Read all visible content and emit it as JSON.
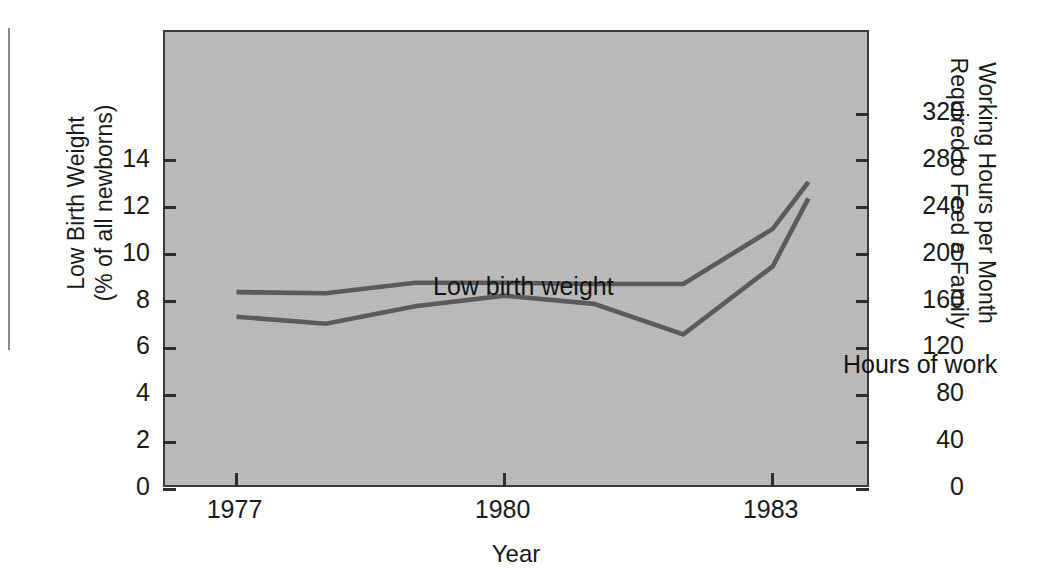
{
  "figure": {
    "background_color": "#ffffff",
    "plot_background_color": "#b9b9b9",
    "line_color": "#5b5b5b",
    "axis_color": "#2e2e2e",
    "width": 1041,
    "height": 581
  },
  "chart_data": {
    "type": "line",
    "title": "",
    "subtitle": "",
    "xlabel": "Year",
    "ylabel": "Low Birth Weight\n(% of all newborns)",
    "y2label": "Working Hours per Month\nRequired to Feed a Family",
    "grid": false,
    "legend_position": "inline-annotations",
    "xlim": [
      1976.2,
      1984.1
    ],
    "ylim": [
      0,
      19.5
    ],
    "y2lim": [
      0,
      390
    ],
    "xticks": [
      1977,
      1980,
      1983
    ],
    "xticklabels": [
      "1977",
      "1980",
      "1983"
    ],
    "yticks": [
      0,
      2,
      4,
      6,
      8,
      10,
      12,
      14
    ],
    "yticklabels": [
      "0",
      "2",
      "4",
      "6",
      "8",
      "10",
      "12",
      "14"
    ],
    "y2ticks": [
      0,
      40,
      80,
      120,
      160,
      200,
      240,
      280,
      320
    ],
    "y2ticklabels": [
      "0",
      "40",
      "80",
      "120",
      "160",
      "200",
      "240",
      "280",
      "320"
    ],
    "x": [
      1977,
      1978,
      1979,
      1980,
      1981,
      1982,
      1983,
      1983.4
    ],
    "series": [
      {
        "name": "Low birth weight",
        "axis": "left",
        "units": "% of all newborns",
        "annotation": "Low birth weight",
        "values": [
          8.4,
          8.35,
          8.8,
          8.8,
          8.75,
          8.75,
          11.1,
          13.1
        ]
      },
      {
        "name": "Hours of work",
        "axis": "right",
        "units": "working hours per month",
        "annotation": "Hours of work",
        "values": [
          147,
          141,
          156,
          165,
          158,
          132,
          190,
          248
        ]
      }
    ]
  },
  "annotations": {
    "low_birth_weight": "Low birth weight",
    "hours_of_work": "Hours of work"
  },
  "axes": {
    "x_title": "Year",
    "left_title": "Low Birth Weight\n(% of all newborns)",
    "right_title": "Working Hours per Month\nRequired to Feed a Family"
  }
}
